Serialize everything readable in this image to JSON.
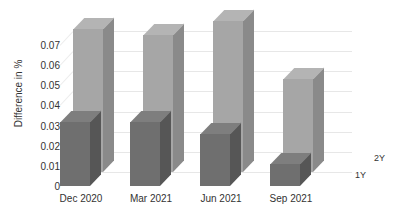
{
  "chart_data": {
    "type": "bar",
    "title": "",
    "xlabel": "",
    "ylabel": "Difference in %",
    "categories": [
      "Dec 2020",
      "Mar 2021",
      "Jun 2021",
      "Sep 2021"
    ],
    "series": [
      {
        "name": "1Y",
        "values": [
          0.032,
          0.032,
          0.026,
          0.011
        ],
        "color": "#6f6f6f"
      },
      {
        "name": "2Y",
        "values": [
          0.071,
          0.068,
          0.075,
          0.046
        ],
        "color": "#a6a6a6"
      }
    ],
    "ylim": [
      0,
      0.075
    ],
    "yticks": [
      0,
      0.01,
      0.02,
      0.03,
      0.04,
      0.05,
      0.06,
      0.07
    ],
    "ytick_labels": [
      "0",
      "0.01",
      "0.02",
      "0.03",
      "0.04",
      "0.05",
      "0.06",
      "0.07"
    ],
    "grid": true,
    "legend_position": "depth-axis",
    "three_d": true,
    "annotations": []
  },
  "axes": {
    "y_title": "Difference in %"
  }
}
